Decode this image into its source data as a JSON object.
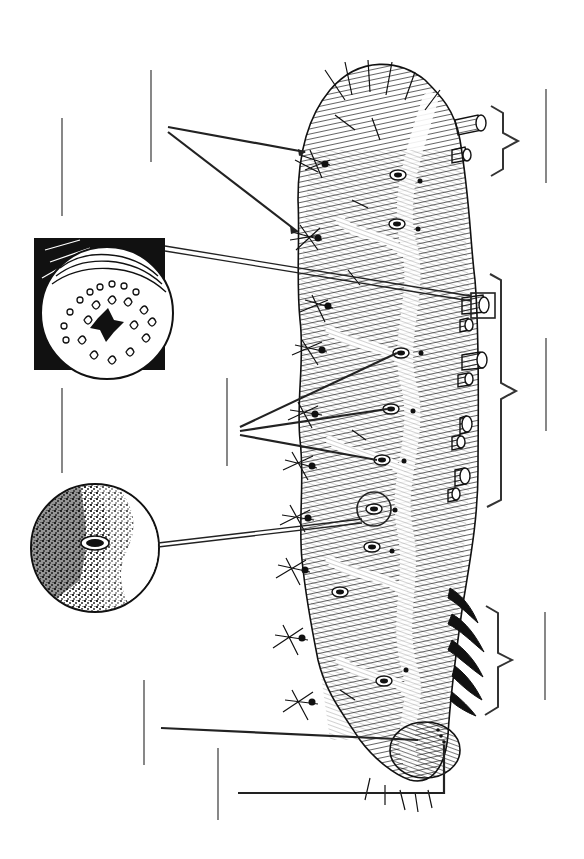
{
  "diagram": {
    "subject": "Caterpillar external anatomy (unlabeled worksheet)",
    "orientation": "rotated 90 degrees; head at bottom, posterior at top",
    "colors": {
      "ink": "#1a1a1a",
      "label_line": "#6a6a6a",
      "background": "#ffffff"
    },
    "labels": [
      {
        "id": "label-setae",
        "text": "",
        "target": "setae (hairs/spines)",
        "line": [
          151,
          70,
          151,
          162
        ]
      },
      {
        "id": "label-proleg-detail",
        "text": "",
        "target": "proleg crochets (inset)",
        "line": [
          62,
          118,
          62,
          216
        ]
      },
      {
        "id": "label-spiracles",
        "text": "",
        "target": "spiracles",
        "line": [
          227,
          380,
          227,
          466
        ]
      },
      {
        "id": "label-spiracle-detail",
        "text": "",
        "target": "spiracle (inset)",
        "line": [
          62,
          388,
          62,
          473
        ]
      },
      {
        "id": "label-head",
        "text": "",
        "target": "head / ocelli",
        "line": [
          144,
          680,
          144,
          765
        ]
      },
      {
        "id": "label-mouthparts",
        "text": "",
        "target": "mouthparts / ocelli",
        "line": [
          218,
          748,
          218,
          820
        ]
      },
      {
        "id": "label-abdomen-posterior",
        "text": "",
        "target": "posterior abdominal segments",
        "line": [
          546,
          89,
          546,
          183
        ]
      },
      {
        "id": "label-abdomen-prolegs",
        "text": "",
        "target": "abdomen with prolegs",
        "line": [
          546,
          338,
          546,
          431
        ]
      },
      {
        "id": "label-thorax",
        "text": "",
        "target": "thorax with true legs",
        "line": [
          545,
          612,
          545,
          700
        ]
      }
    ],
    "insets": [
      {
        "id": "proleg-inset",
        "shape": "square-with-circle",
        "box": [
          34,
          238,
          165,
          370
        ]
      },
      {
        "id": "spiracle-inset",
        "shape": "circle",
        "center": [
          95,
          548
        ],
        "radius": 64
      }
    ],
    "brackets": [
      {
        "id": "bracket-posterior",
        "top": 106,
        "bottom": 174,
        "x": 492,
        "tip_x": 518
      },
      {
        "id": "bracket-abdomen",
        "top": 274,
        "bottom": 506,
        "x": 502,
        "tip_x": 516
      },
      {
        "id": "bracket-thorax",
        "top": 606,
        "bottom": 715,
        "x": 498,
        "tip_x": 512
      }
    ]
  }
}
